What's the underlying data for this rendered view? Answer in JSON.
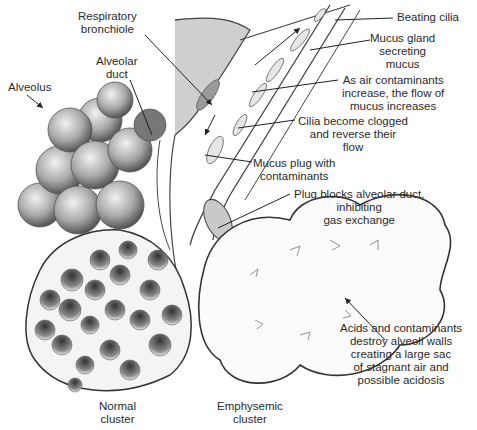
{
  "diagram": {
    "labels": {
      "respiratory_bronchiole": [
        "Respiratory",
        "bronchiole"
      ],
      "alveolar_duct": [
        "Alveolar",
        "duct"
      ],
      "alveolus": [
        "Alveolus"
      ],
      "beating_cilia": [
        "Beating cilia"
      ],
      "mucus_gland": [
        "Mucus gland",
        "secreting",
        "mucus"
      ],
      "air_contaminants": [
        "As air contaminants",
        "increase, the flow of",
        "mucus increases"
      ],
      "cilia_clogged": [
        "Cilia become clogged",
        "and reverse their",
        "flow"
      ],
      "mucus_plug": [
        "Mucus plug with",
        "contaminants"
      ],
      "plug_blocks": [
        "Plug blocks alveolar duct,",
        "inhibiting",
        "gas exchange"
      ],
      "acids": [
        "Acids and contaminants",
        "destroy alveoli walls",
        "creating a large sac",
        "of stagnant air and",
        "possible acidosis"
      ],
      "normal_cluster": [
        "Normal",
        "cluster"
      ],
      "emphysemic_cluster": [
        "Emphysemic",
        "cluster"
      ]
    },
    "colors": {
      "ink": "#222222",
      "shade": "#8a8a8a",
      "light": "#d8d8d8",
      "background": "#ffffff"
    }
  }
}
